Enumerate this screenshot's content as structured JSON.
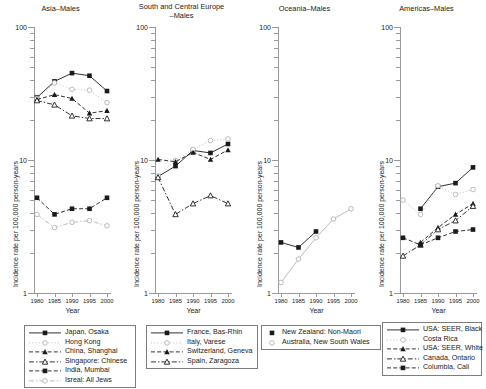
{
  "figure": {
    "axis_y_title": "Incidence rate per 100,000 person-years",
    "axis_x_title": "Year",
    "y_major_labels": [
      "100",
      "10",
      "1"
    ],
    "x_tick_labels": [
      "1980",
      "1985",
      "1990",
      "1995",
      "2000"
    ]
  },
  "chart_data": [
    {
      "type": "line",
      "title": "Asia–Males",
      "xlabel": "Year",
      "ylabel": "Incidence rate per 100,000 person-years",
      "x": [
        1980,
        1985,
        1990,
        1995,
        2000
      ],
      "ylim": [
        1,
        100
      ],
      "yscale": "log",
      "grid": false,
      "legend_position": "below",
      "series": [
        {
          "name": "Japan, Osaka",
          "marker": "filled-square",
          "line": "solid",
          "values": [
            29.5,
            39.0,
            45.0,
            43.0,
            33.0
          ]
        },
        {
          "name": "Hong Kong",
          "marker": "open-circle",
          "line": "dotted",
          "values": [
            29.0,
            38.0,
            34.0,
            33.5,
            27.0
          ]
        },
        {
          "name": "China, Shanghai",
          "marker": "filled-triangle",
          "line": "dashed",
          "values": [
            28.5,
            31.0,
            29.0,
            22.5,
            23.5
          ]
        },
        {
          "name": "Singapore: Chinese",
          "marker": "open-triangle",
          "line": "dash-dot",
          "values": [
            28.0,
            26.0,
            21.5,
            20.5,
            20.5
          ]
        },
        {
          "name": "India, Mumbai",
          "marker": "filled-square",
          "line": "dashed",
          "values": [
            5.2,
            3.9,
            4.3,
            4.3,
            5.2
          ]
        },
        {
          "name": "Isreal: All Jews",
          "marker": "open-circle",
          "line": "dash-dot",
          "values": [
            3.9,
            3.1,
            3.4,
            3.5,
            3.2
          ]
        }
      ]
    },
    {
      "type": "line",
      "title": "South and Central Europe\n–Males",
      "xlabel": "Year",
      "ylabel": "Incidence rate per 100,000 person-years",
      "x": [
        1980,
        1985,
        1990,
        1995,
        2000
      ],
      "ylim": [
        1,
        100
      ],
      "yscale": "log",
      "grid": false,
      "legend_position": "below",
      "series": [
        {
          "name": "France, Bas-Rhin",
          "marker": "filled-square",
          "line": "solid",
          "values": [
            7.5,
            9.0,
            11.8,
            11.3,
            13.2
          ]
        },
        {
          "name": "Italy, Varese",
          "marker": "open-circle",
          "line": "dotted",
          "values": [
            7.6,
            9.9,
            12.0,
            14.0,
            14.4
          ]
        },
        {
          "name": "Switzerland, Geneva",
          "marker": "filled-triangle",
          "line": "dashed",
          "values": [
            10.1,
            9.7,
            11.4,
            10.1,
            11.9
          ]
        },
        {
          "name": "Spain, Zaragoza",
          "marker": "open-triangle",
          "line": "dash-dot",
          "values": [
            7.4,
            3.9,
            4.7,
            5.4,
            4.7
          ]
        }
      ]
    },
    {
      "type": "line",
      "title": "Oceania–Males",
      "xlabel": "Year",
      "ylabel": "Incidence rate per 100,000 person-years",
      "x": [
        1980,
        1985,
        1990,
        1995,
        2000
      ],
      "ylim": [
        1,
        100
      ],
      "yscale": "log",
      "grid": false,
      "legend_position": "below",
      "series": [
        {
          "name": "New Zealand: Non-Maori",
          "marker": "filled-square",
          "line": "solid",
          "values": [
            2.4,
            2.2,
            2.9,
            null,
            null
          ]
        },
        {
          "name": "Australia, New South Wales",
          "marker": "open-circle",
          "line": "solid",
          "values": [
            1.2,
            1.8,
            2.6,
            3.6,
            4.3
          ]
        }
      ]
    },
    {
      "type": "line",
      "title": "Americas–Males",
      "xlabel": "Year",
      "ylabel": "Incidence rate per 100,000 person-years",
      "x": [
        1980,
        1985,
        1990,
        1995,
        2000
      ],
      "ylim": [
        1,
        100
      ],
      "yscale": "log",
      "grid": false,
      "legend_position": "below",
      "series": [
        {
          "name": "USA: SEER, Black",
          "marker": "filled-square",
          "line": "solid",
          "values": [
            null,
            4.3,
            6.3,
            6.7,
            8.8
          ]
        },
        {
          "name": "Costa Rica",
          "marker": "open-circle",
          "line": "dotted",
          "values": [
            5.0,
            3.9,
            6.4,
            5.5,
            6.0
          ]
        },
        {
          "name": "USA: SEER, White",
          "marker": "filled-triangle",
          "line": "dashed",
          "values": [
            null,
            2.4,
            3.1,
            3.9,
            4.7
          ]
        },
        {
          "name": "Canada, Ontario",
          "marker": "open-triangle",
          "line": "dash-dot",
          "values": [
            1.9,
            2.3,
            3.0,
            3.5,
            4.5
          ]
        },
        {
          "name": "Columbia, Cali",
          "marker": "filled-square",
          "line": "dashed",
          "values": [
            2.6,
            2.3,
            2.6,
            2.9,
            3.0
          ]
        }
      ]
    }
  ],
  "legends": [
    {
      "panel": "Asia–Males",
      "items": [
        {
          "label": "Japan, Osaka",
          "marker": "filled-square",
          "line": "solid"
        },
        {
          "label": "Hong Kong",
          "marker": "open-circle",
          "line": "dotted"
        },
        {
          "label": "China, Shanghai",
          "marker": "filled-triangle",
          "line": "dashed"
        },
        {
          "label": "Singapore: Chinese",
          "marker": "open-triangle",
          "line": "dash-dot"
        },
        {
          "label": "India, Mumbai",
          "marker": "filled-square",
          "line": "dashed"
        },
        {
          "label": "Isreal: All Jews",
          "marker": "open-circle",
          "line": "dash-dot"
        }
      ]
    },
    {
      "panel": "South and Central Europe–Males",
      "items": [
        {
          "label": "France, Bas-Rhin",
          "marker": "filled-square",
          "line": "solid"
        },
        {
          "label": "Italy, Varese",
          "marker": "open-circle",
          "line": "dotted"
        },
        {
          "label": "Switzerland, Geneva",
          "marker": "filled-triangle",
          "line": "dashed"
        },
        {
          "label": "Spain, Zaragoza",
          "marker": "open-triangle",
          "line": "dash-dot"
        }
      ]
    },
    {
      "panel": "Oceania–Males",
      "items": [
        {
          "label": "New Zealand: Non-Maori",
          "marker": "filled-square",
          "line": "solid"
        },
        {
          "label": "Australia, New South Wales",
          "marker": "open-circle",
          "line": "dotted"
        }
      ]
    },
    {
      "panel": "Americas–Males",
      "items": [
        {
          "label": "USA: SEER, Black",
          "marker": "filled-square",
          "line": "solid"
        },
        {
          "label": "Costa Rica",
          "marker": "open-circle",
          "line": "dotted"
        },
        {
          "label": "USA: SEER, White",
          "marker": "filled-triangle",
          "line": "dashed"
        },
        {
          "label": "Canada, Ontario",
          "marker": "open-triangle",
          "line": "dash-dot"
        },
        {
          "label": "Columbia, Cali",
          "marker": "filled-square",
          "line": "dashed"
        }
      ]
    }
  ],
  "colors": {
    "ink": "#1a1a1a",
    "axis": "#9a9a9a",
    "light_series": "#b4b4b4"
  }
}
